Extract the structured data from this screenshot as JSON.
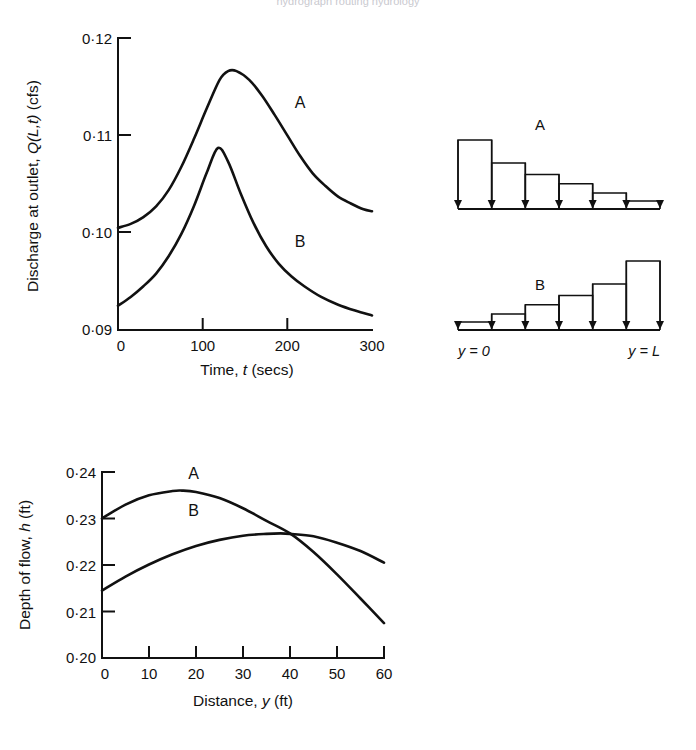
{
  "page": {
    "background_color": "#ffffff",
    "ink_color": "#111111",
    "clipped_header_text": "hydrograph  routing  hydrology"
  },
  "chart_data": [
    {
      "id": "discharge-chart",
      "type": "line",
      "title": "",
      "xlabel_parts": {
        "lead": "Time, ",
        "symbol": "t",
        "unit": " (secs)"
      },
      "xlabel": "Time, t (secs)",
      "ylabel_parts": {
        "lead": "Discharge at outlet, ",
        "symbol": "Q(L,t)",
        "unit": " (cfs)"
      },
      "ylabel": "Discharge at outlet, Q(L,t) (cfs)",
      "xlim": [
        0,
        300
      ],
      "ylim": [
        0.09,
        0.12
      ],
      "xticks": [
        0,
        100,
        200,
        300
      ],
      "xtick_labels": [
        "0",
        "100",
        "200",
        "300"
      ],
      "yticks": [
        0.09,
        0.1,
        0.11,
        0.12
      ],
      "ytick_labels": [
        "0·09",
        "0·10",
        "0·11",
        "0·12"
      ],
      "grid": false,
      "legend": "inline-labels",
      "series": [
        {
          "name": "A",
          "label": "A",
          "label_at": {
            "x": 215,
            "y": 0.1128
          },
          "x": [
            0,
            15,
            30,
            45,
            60,
            75,
            90,
            105,
            120,
            130,
            140,
            155,
            170,
            185,
            200,
            215,
            230,
            245,
            260,
            275,
            290,
            300
          ],
          "values": [
            0.1005,
            0.1009,
            0.1016,
            0.1027,
            0.1044,
            0.1068,
            0.1097,
            0.1128,
            0.1157,
            0.1166,
            0.1166,
            0.1157,
            0.1141,
            0.1121,
            0.11,
            0.1079,
            0.1061,
            0.1048,
            0.1037,
            0.103,
            0.1024,
            0.1022
          ]
        },
        {
          "name": "B",
          "label": "B",
          "label_at": {
            "x": 215,
            "y": 0.0985
          },
          "x": [
            0,
            15,
            30,
            45,
            60,
            75,
            90,
            105,
            118,
            130,
            145,
            160,
            175,
            190,
            205,
            220,
            240,
            260,
            280,
            300
          ],
          "values": [
            0.0925,
            0.0934,
            0.0945,
            0.0958,
            0.0976,
            0.0999,
            0.1028,
            0.1062,
            0.1087,
            0.1073,
            0.104,
            0.101,
            0.0986,
            0.0968,
            0.0955,
            0.0945,
            0.0934,
            0.0926,
            0.092,
            0.0915
          ]
        }
      ]
    },
    {
      "id": "depth-chart",
      "type": "line",
      "title": "",
      "xlabel_parts": {
        "lead": "Distance, ",
        "symbol": "y",
        "unit": " (ft)"
      },
      "xlabel": "Distance, y (ft)",
      "ylabel_parts": {
        "lead": "Depth of flow, ",
        "symbol": "h",
        "unit": " (ft)"
      },
      "ylabel": "Depth of flow, h (ft)",
      "xlim": [
        0,
        60
      ],
      "ylim": [
        0.2,
        0.24
      ],
      "xticks": [
        0,
        10,
        20,
        30,
        40,
        50,
        60
      ],
      "xtick_labels": [
        "0",
        "10",
        "20",
        "30",
        "40",
        "50",
        "60"
      ],
      "yticks": [
        0.2,
        0.21,
        0.22,
        0.23,
        0.24
      ],
      "ytick_labels": [
        "0·20",
        "0·21",
        "0·22",
        "0·23",
        "0·24"
      ],
      "grid": false,
      "legend": "inline-labels",
      "crossing_point": {
        "x": 41,
        "y": 0.2265
      },
      "series": [
        {
          "name": "A",
          "label": "A",
          "label_at": {
            "x": 19.5,
            "y": 0.2385
          },
          "x": [
            0,
            5,
            10,
            15,
            17,
            20,
            25,
            30,
            35,
            40,
            45,
            50,
            55,
            60
          ],
          "values": [
            0.23,
            0.233,
            0.235,
            0.2359,
            0.236,
            0.2357,
            0.2344,
            0.2322,
            0.2295,
            0.2268,
            0.2228,
            0.218,
            0.2128,
            0.2075
          ]
        },
        {
          "name": "B",
          "label": "B",
          "label_at": {
            "x": 19.5,
            "y": 0.2305
          },
          "x": [
            0,
            5,
            10,
            15,
            20,
            25,
            30,
            35,
            38,
            40,
            45,
            50,
            55,
            60
          ],
          "values": [
            0.2145,
            0.2175,
            0.2201,
            0.2223,
            0.2241,
            0.2254,
            0.2263,
            0.2267,
            0.2268,
            0.2267,
            0.2262,
            0.2248,
            0.223,
            0.2205
          ]
        }
      ]
    },
    {
      "id": "rainfall-pattern-A",
      "type": "bar",
      "title": "A",
      "label": "A",
      "description": "decreasing lateral inflow distribution",
      "categories": [
        "1",
        "2",
        "3",
        "4",
        "5",
        "6"
      ],
      "values": [
        6.0,
        4.0,
        3.0,
        2.2,
        1.4,
        0.7
      ],
      "arrow_count": 7,
      "left_label": "y = 0",
      "right_label": "y = L"
    },
    {
      "id": "rainfall-pattern-B",
      "type": "bar",
      "title": "B",
      "label": "B",
      "description": "increasing lateral inflow distribution",
      "categories": [
        "1",
        "2",
        "3",
        "4",
        "5",
        "6"
      ],
      "values": [
        0.7,
        1.4,
        2.2,
        3.0,
        4.0,
        6.0
      ],
      "arrow_count": 7,
      "left_label": "y = 0",
      "right_label": "y = L"
    }
  ],
  "labels": {
    "axis_left_position": "y = 0",
    "axis_right_position": "y = L"
  }
}
